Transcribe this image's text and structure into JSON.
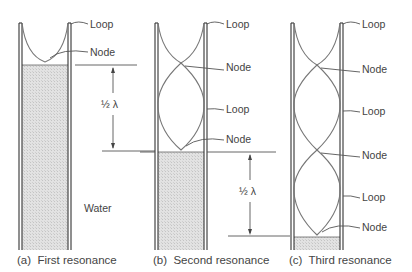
{
  "diagram": {
    "panels": [
      {
        "id": "a",
        "caption": "(a)  First resonance",
        "labels": [
          "Loop",
          "Node"
        ],
        "water_label": "Water"
      },
      {
        "id": "b",
        "caption": "(b)  Second resonance",
        "labels": [
          "Loop",
          "Node",
          "Loop",
          "Node"
        ]
      },
      {
        "id": "c",
        "caption": "(c)  Third resonance",
        "labels": [
          "Loop",
          "Node",
          "Loop",
          "Node",
          "Loop",
          "Node"
        ]
      }
    ],
    "dimension_labels": [
      "½ λ",
      "½ λ"
    ],
    "colors": {
      "wall": "#333333",
      "wave": "#777777",
      "water": "#d8d8d8",
      "text": "#444444"
    }
  }
}
